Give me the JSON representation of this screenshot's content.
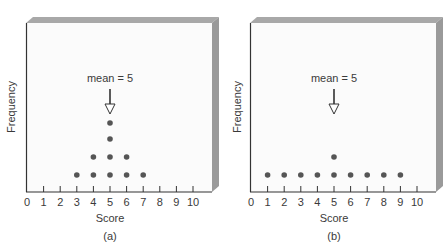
{
  "chart_data": [
    {
      "type": "scatter",
      "subtype": "dot-plot",
      "panel_label": "(a)",
      "title": "",
      "xlabel": "Score",
      "ylabel": "Frequency",
      "xlim": [
        0,
        10
      ],
      "x_ticks": [
        0,
        1,
        2,
        3,
        4,
        5,
        6,
        7,
        8,
        9,
        10
      ],
      "grid": false,
      "annotation": {
        "text": "mean = 5",
        "x": 5
      },
      "categories": [
        3,
        4,
        5,
        6,
        7
      ],
      "values": [
        1,
        2,
        4,
        2,
        1
      ],
      "points": [
        {
          "x": 3,
          "y": 1
        },
        {
          "x": 4,
          "y": 1
        },
        {
          "x": 4,
          "y": 2
        },
        {
          "x": 5,
          "y": 1
        },
        {
          "x": 5,
          "y": 2
        },
        {
          "x": 5,
          "y": 3
        },
        {
          "x": 5,
          "y": 4
        },
        {
          "x": 6,
          "y": 1
        },
        {
          "x": 6,
          "y": 2
        },
        {
          "x": 7,
          "y": 1
        }
      ]
    },
    {
      "type": "scatter",
      "subtype": "dot-plot",
      "panel_label": "(b)",
      "title": "",
      "xlabel": "Score",
      "ylabel": "Frequency",
      "xlim": [
        0,
        10
      ],
      "x_ticks": [
        0,
        1,
        2,
        3,
        4,
        5,
        6,
        7,
        8,
        9,
        10
      ],
      "grid": false,
      "annotation": {
        "text": "mean = 5",
        "x": 5
      },
      "categories": [
        1,
        2,
        3,
        4,
        5,
        6,
        7,
        8,
        9
      ],
      "values": [
        1,
        1,
        1,
        1,
        2,
        1,
        1,
        1,
        1
      ],
      "points": [
        {
          "x": 1,
          "y": 1
        },
        {
          "x": 2,
          "y": 1
        },
        {
          "x": 3,
          "y": 1
        },
        {
          "x": 4,
          "y": 1
        },
        {
          "x": 5,
          "y": 1
        },
        {
          "x": 5,
          "y": 2
        },
        {
          "x": 6,
          "y": 1
        },
        {
          "x": 7,
          "y": 1
        },
        {
          "x": 8,
          "y": 1
        },
        {
          "x": 9,
          "y": 1
        }
      ]
    }
  ],
  "colors": {
    "face": "#fbfbfb",
    "bevel_top": "#a8a8a8",
    "bevel_side": "#9a9a9a",
    "axis": "#333333",
    "dot": "#555555",
    "text": "#3a3a3a"
  }
}
